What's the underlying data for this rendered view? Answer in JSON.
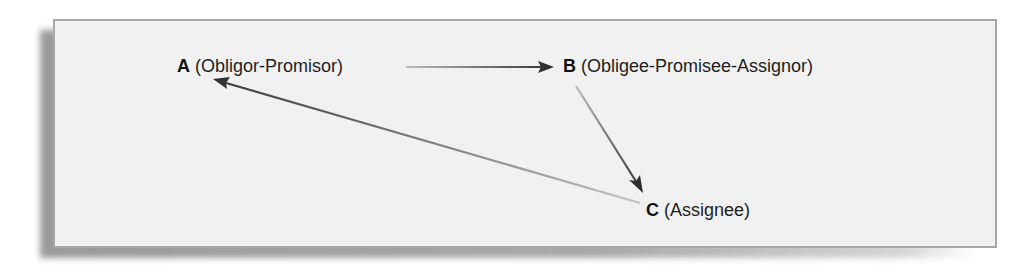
{
  "diagram": {
    "type": "assignment-relationship",
    "nodes": [
      {
        "id": "A",
        "letter": "A",
        "role": "(Obligor-Promisor)"
      },
      {
        "id": "B",
        "letter": "B",
        "role": "(Obligee-Promisee-Assignor)"
      },
      {
        "id": "C",
        "letter": "C",
        "role": "(Assignee)"
      }
    ],
    "edges": [
      {
        "from": "A",
        "to": "B"
      },
      {
        "from": "B",
        "to": "C"
      },
      {
        "from": "C",
        "to": "A"
      }
    ],
    "colors": {
      "panel_background": "#f1f1f1",
      "panel_border": "#a8a8a8",
      "arrow_light": "#b4b4b4",
      "arrow_dark": "#3a3a3a",
      "text": "#1e1e1e"
    }
  }
}
